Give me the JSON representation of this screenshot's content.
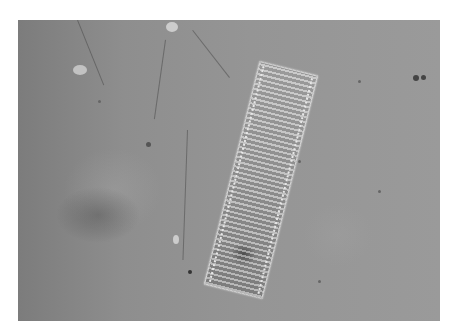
{
  "image": {
    "description": "Phase-contrast micrograph of a rectangular pennate diatom (tilted frustule with transverse striae) on a gray background with scattered particles",
    "alt": "Micrograph of a diatom",
    "frame": {
      "x": 18,
      "y": 20,
      "width": 422,
      "height": 301
    },
    "colors": {
      "background": "#8f8f8f",
      "page": "#ffffff",
      "frustule_edge": "#d8d8d8"
    }
  }
}
